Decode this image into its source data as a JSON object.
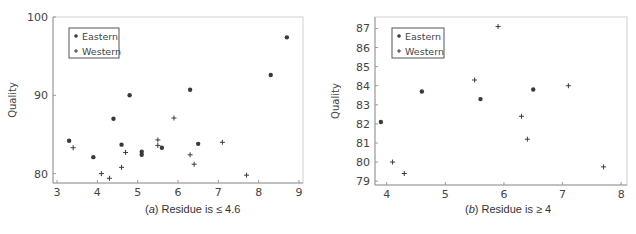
{
  "chart_data": [
    {
      "type": "scatter",
      "panel": "a",
      "caption": "(a) Residue is ≤ 4.6",
      "caption_letter": "a",
      "caption_rest": " Residue is ≤ 4.6",
      "xlabel": "Foam",
      "ylabel": "Quality",
      "xlim": [
        2.9,
        9.1
      ],
      "ylim": [
        78.8,
        100
      ],
      "xticks": [
        3,
        4,
        5,
        6,
        7,
        8,
        9
      ],
      "yticks": [
        80,
        90,
        100
      ],
      "grid": false,
      "legend": {
        "position": "upper-left",
        "entries": [
          "Eastern",
          "Western"
        ]
      },
      "series": [
        {
          "name": "Eastern",
          "marker": "dot",
          "points": [
            [
              3.3,
              84.2
            ],
            [
              3.9,
              82.1
            ],
            [
              4.4,
              87.0
            ],
            [
              4.6,
              83.7
            ],
            [
              4.8,
              90.0
            ],
            [
              5.1,
              82.8
            ],
            [
              5.1,
              82.4
            ],
            [
              5.6,
              83.3
            ],
            [
              6.3,
              90.7
            ],
            [
              6.5,
              83.8
            ],
            [
              8.3,
              92.6
            ],
            [
              8.7,
              97.4
            ]
          ]
        },
        {
          "name": "Western",
          "marker": "plus",
          "points": [
            [
              3.4,
              83.3
            ],
            [
              4.1,
              80.0
            ],
            [
              4.3,
              79.4
            ],
            [
              4.6,
              80.8
            ],
            [
              4.7,
              82.7
            ],
            [
              5.5,
              84.3
            ],
            [
              5.5,
              83.6
            ],
            [
              5.9,
              87.1
            ],
            [
              6.3,
              82.4
            ],
            [
              6.4,
              81.2
            ],
            [
              7.1,
              84.0
            ],
            [
              7.7,
              79.8
            ]
          ]
        }
      ]
    },
    {
      "type": "scatter",
      "panel": "b",
      "caption": "(b) Residue is ≥ 4",
      "caption_letter": "b",
      "caption_rest": " Residue is ≥ 4",
      "xlabel": "Foam",
      "ylabel": "Quality",
      "xlim": [
        3.8,
        8.1
      ],
      "ylim": [
        78.8,
        87.6
      ],
      "xticks": [
        4,
        5,
        6,
        7,
        8
      ],
      "yticks": [
        79,
        80,
        81,
        82,
        83,
        84,
        85,
        86,
        87
      ],
      "grid": false,
      "legend": {
        "position": "upper-left",
        "entries": [
          "Eastern",
          "Western"
        ]
      },
      "series": [
        {
          "name": "Eastern",
          "marker": "dot",
          "points": [
            [
              3.9,
              82.1
            ],
            [
              4.6,
              83.7
            ],
            [
              5.6,
              83.3
            ],
            [
              6.5,
              83.8
            ]
          ]
        },
        {
          "name": "Western",
          "marker": "plus",
          "points": [
            [
              4.1,
              80.0
            ],
            [
              4.3,
              79.4
            ],
            [
              5.5,
              84.3
            ],
            [
              5.9,
              87.1
            ],
            [
              6.3,
              82.4
            ],
            [
              6.4,
              81.2
            ],
            [
              7.1,
              84.0
            ],
            [
              7.7,
              79.75
            ]
          ]
        }
      ]
    }
  ],
  "colors": {
    "axis": "#9a9a9a",
    "marker": "#3a3a3a",
    "text": "#444444",
    "legend_border": "#555555"
  }
}
